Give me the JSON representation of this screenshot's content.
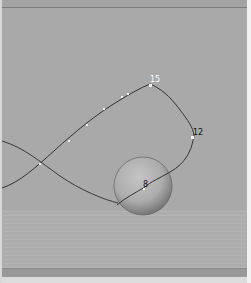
{
  "viewport": {
    "background_color": "#a9a9a9",
    "description": "3D viewport with motion path curve and sphere over ground grid"
  },
  "curve": {
    "labels": [
      {
        "text": "15",
        "x": 153,
        "y": 81
      },
      {
        "text": "12",
        "x": 196,
        "y": 133
      },
      {
        "text": "8",
        "x": 145,
        "y": 186
      }
    ]
  },
  "sphere": {
    "cx": 143,
    "cy": 186,
    "r": 29
  }
}
